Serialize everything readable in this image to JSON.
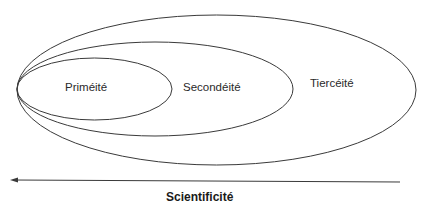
{
  "diagram": {
    "type": "nested-ellipses",
    "ellipses": [
      {
        "id": "inner",
        "label": "Priméité"
      },
      {
        "id": "middle",
        "label": "Secondéité"
      },
      {
        "id": "outer",
        "label": "Tiercéité"
      }
    ],
    "arrow": {
      "direction": "left",
      "label": "Scientificité"
    },
    "colors": {
      "stroke": "#3a3a3a",
      "text": "#2a2a2a",
      "background": "#ffffff"
    }
  }
}
